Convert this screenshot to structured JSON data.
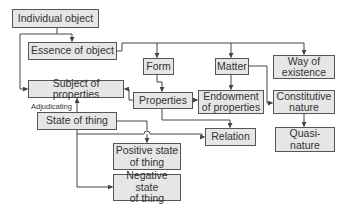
{
  "diagram": {
    "colors": {
      "box_fill": "#e6e6e6",
      "box_border": "#555555",
      "line": "#444444",
      "text": "#333333",
      "background": "#ffffff"
    },
    "nodes": {
      "individual_object": "Individual object",
      "essence_of_object": "Essence of object",
      "form": "Form",
      "matter": "Matter",
      "way_of_existence": "Way of\nexistence",
      "subject_of_properties": "Subject of properties",
      "properties": "Properties",
      "endowment_of_properties": "Endowment\nof properties",
      "constitutive_nature": "Constitutive\nnature",
      "state_of_thing": "State of thing",
      "relation": "Relation",
      "quasi_nature": "Quasi-\nnature",
      "positive_state_of_thing": "Positive state\nof thing",
      "negative_state_of_thing": "Negative state\nof thing"
    },
    "labels": {
      "adjudicating": "Adjudicating"
    },
    "edges": [
      {
        "from": "Individual object",
        "to": "Essence of object"
      },
      {
        "from": "Individual object",
        "to": "Subject of properties"
      },
      {
        "from": "Essence of object",
        "to": "Form"
      },
      {
        "from": "Essence of object",
        "to": "Matter"
      },
      {
        "from": "Essence of object",
        "to": "Way of existence"
      },
      {
        "from": "Form",
        "to": "Properties"
      },
      {
        "from": "Matter",
        "to": "Endowment of properties"
      },
      {
        "from": "Matter",
        "to": "Constitutive nature"
      },
      {
        "from": "Properties",
        "to": "Subject of properties"
      },
      {
        "from": "Properties",
        "to": "Endowment of properties"
      },
      {
        "from": "Properties",
        "to": "Relation"
      },
      {
        "from": "Constitutive nature",
        "to": "Quasi-nature"
      },
      {
        "from": "State of thing",
        "to": "Subject of properties",
        "label": "Adjudicating"
      },
      {
        "from": "State of thing",
        "to": "Relation"
      },
      {
        "from": "State of thing",
        "to": "Positive state of thing"
      },
      {
        "from": "State of thing",
        "to": "Negative state of thing"
      }
    ]
  }
}
